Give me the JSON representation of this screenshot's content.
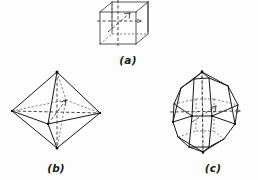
{
  "plate": {
    "background_color": "#fdfdfd",
    "ink_color": "#181818",
    "hidden_edge_color": "#555555",
    "axis_color": "#333333",
    "width": 258,
    "height": 180
  },
  "figures": [
    {
      "id": "a",
      "label": "(a)",
      "name": "cube",
      "description": "Cube (hexahedron) crystal form drawn in oblique projection with three dashed crystallographic axes through the centre",
      "label_x": 128,
      "label_y": 64,
      "axes_count": 3,
      "faces": 6,
      "vertices": 8,
      "edges": 12
    },
    {
      "id": "b",
      "label": "(b)",
      "name": "octahedron",
      "description": "Octahedron crystal form with solid front edges, dashed hidden edges and dashed crystallographic axes",
      "label_x": 56,
      "label_y": 172,
      "axes_count": 3,
      "faces": 8,
      "vertices": 6,
      "edges": 12
    },
    {
      "id": "c",
      "label": "(c)",
      "name": "rhombic-dodecahedron",
      "description": "Rhombic dodecahedron crystal form with dashed hidden edges and dashed crystallographic axes",
      "label_x": 213,
      "label_y": 172,
      "axes_count": 3,
      "faces": 12,
      "vertices": 14,
      "edges": 24
    }
  ]
}
